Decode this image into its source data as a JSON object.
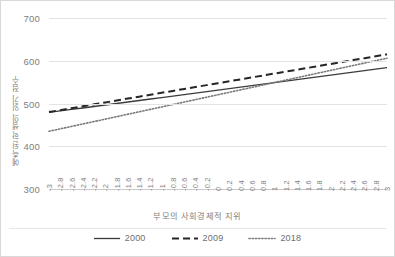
{
  "chart_data": {
    "type": "line",
    "title": "",
    "xlabel": "부모의 사회경제적 지위",
    "ylabel": "예측된 학생의 읽기 점수",
    "xlim": [
      -3,
      3
    ],
    "ylim": [
      300,
      700
    ],
    "grid": true,
    "legend_position": "bottom",
    "y_ticks": [
      700,
      600,
      500,
      400,
      300
    ],
    "categories": [
      "-3",
      "-2.8",
      "-2.6",
      "-2.4",
      "-2.2",
      "-2",
      "-1.8",
      "-1.6",
      "-1.4",
      "-1.2",
      "-1",
      "-0.8",
      "-0.6",
      "-0.4",
      "-0.2",
      "0",
      "0.2",
      "0.4",
      "0.6",
      "0.8",
      "1",
      "1.2",
      "1.4",
      "1.6",
      "1.8",
      "2",
      "2.2",
      "2.4",
      "2.6",
      "2.8",
      "3"
    ],
    "x": [
      -3,
      -2.8,
      -2.6,
      -2.4,
      -2.2,
      -2,
      -1.8,
      -1.6,
      -1.4,
      -1.2,
      -1,
      -0.8,
      -0.6,
      -0.4,
      -0.2,
      0,
      0.2,
      0.4,
      0.6,
      0.8,
      1,
      1.2,
      1.4,
      1.6,
      1.8,
      2,
      2.2,
      2.4,
      2.6,
      2.8,
      3
    ],
    "series": [
      {
        "name": "2000",
        "style": "solid",
        "color": "#3c3c3c",
        "values": [
          479,
          482.5,
          486,
          489.5,
          493,
          496.5,
          500,
          503.5,
          507,
          510.5,
          514,
          517.5,
          521,
          524.5,
          528,
          531.5,
          535,
          538.5,
          542,
          545.5,
          549,
          552.5,
          556,
          559.5,
          563,
          566.5,
          570,
          573.5,
          577,
          580.5,
          584
        ]
      },
      {
        "name": "2009",
        "style": "dashed",
        "color": "#262626",
        "values": [
          480,
          484.5,
          489,
          493.5,
          498,
          502.5,
          507,
          511.5,
          516,
          520.5,
          525,
          529.5,
          534,
          538.5,
          543,
          547.5,
          552,
          556.5,
          561,
          565.5,
          570,
          574.5,
          579,
          583.5,
          588,
          592.5,
          597,
          601.5,
          606,
          610.5,
          615
        ]
      },
      {
        "name": "2018",
        "style": "dotted",
        "color": "#7a7a7a",
        "values": [
          435,
          440.7,
          446.4,
          452.1,
          457.8,
          463.5,
          469.2,
          474.9,
          480.6,
          486.3,
          492,
          497.7,
          503.4,
          509.1,
          514.8,
          520.5,
          526.2,
          531.9,
          537.6,
          543.3,
          549,
          554.7,
          560.4,
          566.1,
          571.8,
          577.5,
          583.2,
          588.9,
          594.6,
          600.3,
          606
        ]
      }
    ]
  },
  "legend": {
    "items": [
      {
        "label": "2000",
        "swatch": "solid-line-swatch"
      },
      {
        "label": "2009",
        "swatch": "dashed-line-swatch"
      },
      {
        "label": "2018",
        "swatch": "dotted-line-swatch"
      }
    ]
  }
}
